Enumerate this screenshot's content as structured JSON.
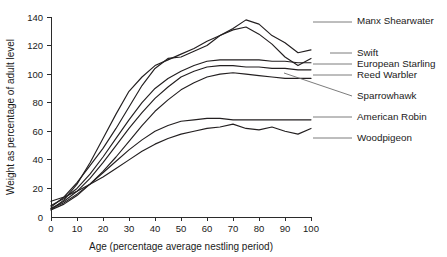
{
  "chart_data": {
    "type": "line",
    "title": "",
    "xlabel": "Age (percentage average nestling period)",
    "ylabel": "Weight as percentage of adult level",
    "xlim": [
      0,
      100
    ],
    "ylim": [
      0,
      140
    ],
    "xticks": [
      0,
      10,
      20,
      30,
      40,
      50,
      60,
      70,
      80,
      90,
      100
    ],
    "yticks": [
      0,
      20,
      40,
      60,
      80,
      100,
      120,
      140
    ],
    "grid": false,
    "legend_position": "right-labels-with-leader-lines",
    "series": [
      {
        "name": "Manx Shearwater",
        "x": [
          0,
          5,
          10,
          15,
          20,
          25,
          30,
          35,
          40,
          45,
          50,
          55,
          60,
          65,
          70,
          75,
          80,
          85,
          90,
          95,
          100
        ],
        "y": [
          7,
          14,
          24,
          36,
          48,
          62,
          77,
          92,
          104,
          111,
          112,
          116,
          120,
          127,
          132,
          138,
          135,
          127,
          122,
          115,
          117
        ]
      },
      {
        "name": "Swift",
        "x": [
          0,
          5,
          10,
          15,
          20,
          25,
          30,
          35,
          40,
          45,
          50,
          55,
          60,
          65,
          70,
          75,
          80,
          85,
          90,
          95,
          100
        ],
        "y": [
          5,
          12,
          23,
          38,
          55,
          72,
          88,
          98,
          106,
          110,
          114,
          118,
          123,
          127,
          131,
          133,
          128,
          121,
          112,
          106,
          111
        ]
      },
      {
        "name": "European Starling",
        "x": [
          0,
          5,
          10,
          15,
          20,
          25,
          30,
          35,
          40,
          45,
          50,
          55,
          60,
          65,
          70,
          75,
          80,
          85,
          90,
          95,
          100
        ],
        "y": [
          8,
          13,
          20,
          30,
          42,
          55,
          68,
          80,
          90,
          97,
          102,
          106,
          109,
          110,
          110,
          110,
          110,
          109,
          109,
          108,
          108
        ]
      },
      {
        "name": "Reed Warbler",
        "x": [
          0,
          5,
          10,
          15,
          20,
          25,
          30,
          35,
          40,
          45,
          50,
          55,
          60,
          65,
          70,
          75,
          80,
          85,
          90,
          95,
          100
        ],
        "y": [
          6,
          11,
          18,
          27,
          38,
          50,
          62,
          73,
          83,
          91,
          98,
          102,
          105,
          106,
          106,
          105,
          105,
          104,
          104,
          103,
          103
        ]
      },
      {
        "name": "Sparrowhawk",
        "x": [
          0,
          5,
          10,
          15,
          20,
          25,
          30,
          35,
          40,
          45,
          50,
          55,
          60,
          65,
          70,
          75,
          80,
          85,
          90,
          95,
          100
        ],
        "y": [
          5,
          9,
          15,
          23,
          32,
          42,
          53,
          64,
          74,
          82,
          89,
          94,
          98,
          100,
          101,
          100,
          99,
          98,
          97,
          97,
          97
        ]
      },
      {
        "name": "American Robin",
        "x": [
          0,
          5,
          10,
          15,
          20,
          25,
          30,
          35,
          40,
          45,
          50,
          55,
          60,
          65,
          70,
          75,
          80,
          85,
          90,
          95,
          100
        ],
        "y": [
          6,
          10,
          16,
          23,
          31,
          39,
          47,
          54,
          60,
          64,
          67,
          68,
          69,
          69,
          68,
          68,
          68,
          68,
          68,
          68,
          68
        ]
      },
      {
        "name": "Woodpigeon",
        "x": [
          0,
          5,
          10,
          15,
          20,
          25,
          30,
          35,
          40,
          45,
          50,
          55,
          60,
          65,
          70,
          75,
          80,
          85,
          90,
          95,
          100
        ],
        "y": [
          11,
          14,
          18,
          23,
          28,
          34,
          40,
          46,
          51,
          55,
          58,
          60,
          62,
          63,
          65,
          62,
          61,
          63,
          60,
          58,
          62
        ]
      }
    ],
    "annotations": [
      {
        "label": "Manx Shearwater",
        "label_x": 357,
        "label_y": 24,
        "leader_from_x": 313,
        "leader_from_y": 22,
        "leader_to_x": 352,
        "leader_to_y": 22
      },
      {
        "label": "Swift",
        "label_x": 357,
        "label_y": 56,
        "leader_from_x": 330,
        "leader_from_y": 53,
        "leader_to_x": 352,
        "leader_to_y": 53
      },
      {
        "label": "European Starling",
        "label_x": 357,
        "label_y": 67,
        "leader_from_x": 313,
        "leader_from_y": 64,
        "leader_to_x": 352,
        "leader_to_y": 64
      },
      {
        "label": "Reed Warbler",
        "label_x": 357,
        "label_y": 78,
        "leader_from_x": 313,
        "leader_from_y": 75,
        "leader_to_x": 352,
        "leader_to_y": 75
      },
      {
        "label": "Sparrowhawk",
        "label_x": 357,
        "label_y": 99,
        "leader_from_x": 284,
        "leader_from_y": 73,
        "leader_to_x": 352,
        "leader_to_y": 96
      },
      {
        "label": "American Robin",
        "label_x": 357,
        "label_y": 120,
        "leader_from_x": 313,
        "leader_from_y": 117,
        "leader_to_x": 352,
        "leader_to_y": 117
      },
      {
        "label": "Woodpigeon",
        "label_x": 357,
        "label_y": 141,
        "leader_from_x": 313,
        "leader_from_y": 138,
        "leader_to_x": 352,
        "leader_to_y": 138
      }
    ]
  },
  "axes": {
    "x_tick_labels": [
      "0",
      "10",
      "20",
      "30",
      "40",
      "50",
      "60",
      "70",
      "80",
      "90",
      "100"
    ],
    "y_tick_labels": [
      "0",
      "20",
      "40",
      "60",
      "80",
      "100",
      "120",
      "140"
    ],
    "x_title": "Age (percentage average nestling period)",
    "y_title": "Weight as percentage of adult level"
  },
  "colors": {
    "line": "#231f20",
    "axis": "#2b2b2b",
    "leader": "#6d6d6d",
    "background": "#ffffff",
    "text": "#1a1a1a"
  }
}
